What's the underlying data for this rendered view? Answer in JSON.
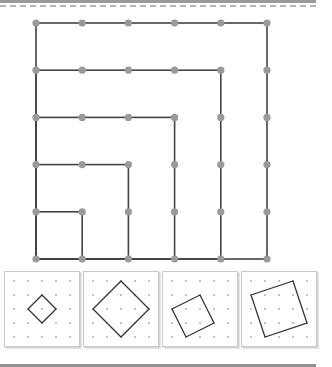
{
  "main_board": {
    "grid": {
      "cols": 6,
      "rows": 6,
      "x0": 36,
      "y0": 23,
      "dx": 46.2,
      "dy": 47.2
    },
    "dot_color": "#9a9a9a",
    "line_color": "#444444",
    "nested_squares": [
      1,
      2,
      3,
      4,
      5
    ],
    "anchor": "bottom-left"
  },
  "panels": [
    {
      "name": "tilted-square-1",
      "vertices": [
        [
          2,
          1
        ],
        [
          3,
          2
        ],
        [
          2,
          3
        ],
        [
          1,
          2
        ]
      ]
    },
    {
      "name": "tilted-square-2",
      "vertices": [
        [
          2,
          0
        ],
        [
          4,
          2
        ],
        [
          2,
          4
        ],
        [
          0,
          2
        ]
      ]
    },
    {
      "name": "tilted-square-3",
      "vertices": [
        [
          0,
          2
        ],
        [
          2,
          1
        ],
        [
          3,
          3
        ],
        [
          1,
          4
        ]
      ]
    },
    {
      "name": "tilted-square-4",
      "vertices": [
        [
          0,
          1
        ],
        [
          3,
          0
        ],
        [
          4,
          3
        ],
        [
          1,
          4
        ]
      ]
    }
  ],
  "panel_grid": {
    "cols": 5,
    "rows": 5,
    "x0": 9,
    "y0": 9,
    "step": 14
  },
  "panel_lefts": [
    4,
    83,
    162,
    241
  ]
}
